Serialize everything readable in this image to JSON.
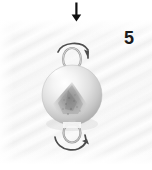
{
  "figure": {
    "step_number": "5",
    "background_color": "#ffffff",
    "texture_color": "#f7f7f7",
    "ink_color": "#1b1b1b"
  },
  "annotations": {
    "down_arrow": {
      "icon": "arrow-down-icon",
      "direction": "down",
      "color": "#111111"
    },
    "top_rotation_arrow": {
      "icon": "rotate-clockwise-arrow-icon",
      "direction": "clockwise",
      "color": "#4a4a4a"
    },
    "bottom_rotation_arrow": {
      "icon": "rotate-counterclockwise-arrow-icon",
      "direction": "counterclockwise",
      "color": "#4a4a4a"
    }
  },
  "object": {
    "name": "silver-round-bead-clasp",
    "body": {
      "shape": "sphere",
      "material": "brushed silver metal",
      "highlight_color": "#fdfdfd",
      "base_color": "#d8d8d8",
      "shadow_color": "#a6a6a6",
      "texture_patch_color": "#8f8f8f"
    },
    "top_loop": {
      "name": "top-eyelet-loop",
      "color": "#9a9a9a"
    },
    "bottom_loop": {
      "name": "bottom-eyelet-loop",
      "color": "#9a9a9a"
    }
  }
}
